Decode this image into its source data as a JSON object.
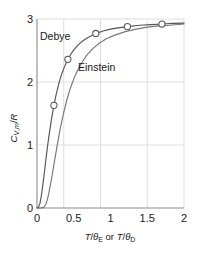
{
  "chart_data": {
    "type": "line",
    "title": "",
    "xlabel": "T/θE or T/θD",
    "ylabel": "CV,m/R",
    "xlim": [
      0,
      2
    ],
    "ylim": [
      0,
      3
    ],
    "xticks": [
      "0",
      "0.5",
      "1",
      "1.5",
      "2"
    ],
    "xtick_values": [
      0,
      0.5,
      1,
      1.5,
      2
    ],
    "yticks": [
      "0",
      "1",
      "2",
      "3"
    ],
    "ytick_values": [
      0,
      1,
      2,
      3
    ],
    "grid": true,
    "legend": "inline-labels",
    "series": [
      {
        "name": "Debye",
        "label": "Debye",
        "color": "#555555",
        "x": [
          0.0,
          0.02,
          0.04,
          0.06,
          0.08,
          0.1,
          0.12,
          0.14,
          0.16,
          0.18,
          0.2,
          0.23,
          0.26,
          0.3,
          0.34,
          0.38,
          0.42,
          0.46,
          0.5,
          0.56,
          0.62,
          0.7,
          0.8,
          0.9,
          1.0,
          1.1,
          1.23,
          1.4,
          1.55,
          1.7,
          1.85,
          2.0
        ],
        "y": [
          0.0,
          0.01,
          0.07,
          0.2,
          0.37,
          0.56,
          0.76,
          0.95,
          1.12,
          1.28,
          1.43,
          1.63,
          1.8,
          1.99,
          2.14,
          2.26,
          2.36,
          2.44,
          2.51,
          2.59,
          2.65,
          2.71,
          2.77,
          2.81,
          2.84,
          2.86,
          2.88,
          2.9,
          2.91,
          2.92,
          2.93,
          2.935
        ],
        "markers": [
          {
            "x": 0.23,
            "y": 1.63
          },
          {
            "x": 0.42,
            "y": 2.36
          },
          {
            "x": 0.8,
            "y": 2.77
          },
          {
            "x": 1.23,
            "y": 2.88
          },
          {
            "x": 1.7,
            "y": 2.92
          }
        ]
      },
      {
        "name": "Einstein",
        "label": "Einstein",
        "color": "#777777",
        "x": [
          0.0,
          0.04,
          0.08,
          0.1,
          0.12,
          0.14,
          0.16,
          0.18,
          0.2,
          0.24,
          0.28,
          0.32,
          0.36,
          0.4,
          0.45,
          0.5,
          0.55,
          0.6,
          0.68,
          0.76,
          0.85,
          0.95,
          1.05,
          1.2,
          1.35,
          1.5,
          1.65,
          1.8,
          2.0
        ],
        "y": [
          0.0,
          0.0,
          0.005,
          0.02,
          0.06,
          0.13,
          0.23,
          0.35,
          0.48,
          0.76,
          1.03,
          1.28,
          1.5,
          1.69,
          1.89,
          2.05,
          2.18,
          2.29,
          2.43,
          2.53,
          2.62,
          2.69,
          2.74,
          2.8,
          2.84,
          2.87,
          2.89,
          2.9,
          2.92
        ],
        "markers": []
      }
    ],
    "annotations": [
      {
        "text": "Debye",
        "x": 0.14,
        "y": 2.68
      },
      {
        "text": "Einstein",
        "x": 0.56,
        "y": 2.18
      }
    ],
    "colors": {
      "grid": "#dcdcdc",
      "axis": "#999999",
      "text": "#1a1a1a",
      "debye_curve": "#555555",
      "einstein_curve": "#777777",
      "marker_fill": "#ffffff",
      "marker_stroke": "#555555",
      "background": "#ffffff"
    }
  }
}
